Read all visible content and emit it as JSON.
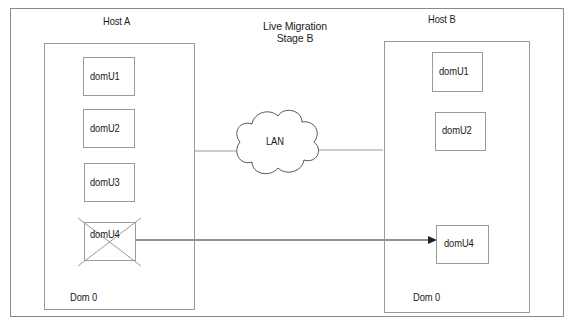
{
  "diagram": {
    "title_line1": "Live Migration",
    "title_line2": "Stage B",
    "network_label": "LAN",
    "host_a": {
      "label": "Host A",
      "dom0_label": "Dom 0",
      "domus": [
        {
          "label": "domU1"
        },
        {
          "label": "domU2"
        },
        {
          "label": "domU3"
        },
        {
          "label": "domU4",
          "crossed_out": true
        }
      ]
    },
    "host_b": {
      "label": "Host B",
      "dom0_label": "Dom 0",
      "domus": [
        {
          "label": "domU1"
        },
        {
          "label": "domU2"
        },
        {
          "label": "domU4"
        }
      ]
    },
    "migration_arrow": {
      "from": "Host A domU4",
      "to": "Host B domU4"
    },
    "colors": {
      "line": "#9a9a9a",
      "arrow": "#222222",
      "text": "#1a1a1a"
    }
  }
}
